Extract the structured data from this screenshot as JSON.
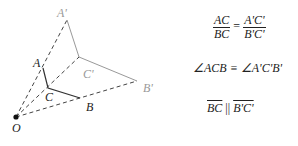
{
  "diagram": {
    "points": {
      "O": {
        "label": "O",
        "x": 16,
        "y": 117
      },
      "A": {
        "label": "A",
        "x": 43,
        "y": 68
      },
      "C": {
        "label": "C",
        "x": 48,
        "y": 88
      },
      "B": {
        "label": "B",
        "x": 80,
        "y": 98
      },
      "A_prime": {
        "label": "A'",
        "x": 67,
        "y": 20
      },
      "C_prime": {
        "label": "C'",
        "x": 79,
        "y": 57
      },
      "B_prime": {
        "label": "B'",
        "x": 137,
        "y": 81
      }
    },
    "colors": {
      "original": "#333333",
      "image": "#999999",
      "dashed": "#444444"
    }
  },
  "relations": {
    "ratio_left_num": "AC",
    "ratio_left_den": "BC",
    "ratio_eq": "=",
    "ratio_right_num": "A'C'",
    "ratio_right_den": "B'C'",
    "angle": "∠ACB ≡ ∠A'C'B'",
    "parallel_left": "BC",
    "parallel_sep": " || ",
    "parallel_right": "B'C'"
  }
}
